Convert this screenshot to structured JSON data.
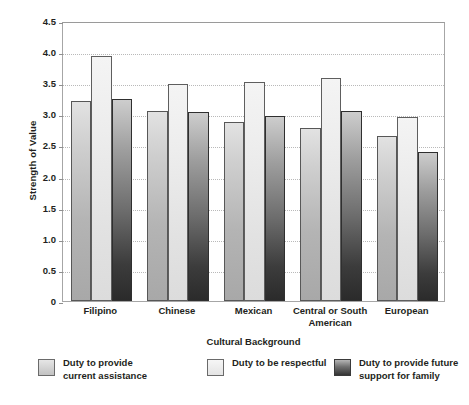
{
  "chart_data": {
    "type": "bar",
    "title": "",
    "xlabel": "Cultural Background",
    "ylabel": "Strength of Value",
    "categories": [
      "Filipino",
      "Chinese",
      "Mexican",
      "Central or South American",
      "European"
    ],
    "series": [
      {
        "name": "Duty to provide current assistance",
        "color": "#c8c8c8",
        "values": [
          3.22,
          3.06,
          2.88,
          2.78,
          2.66
        ]
      },
      {
        "name": "Duty to be respectful",
        "color": "#ededed",
        "values": [
          3.93,
          3.49,
          3.52,
          3.59,
          2.95
        ]
      },
      {
        "name": "Duty to provide future support for family",
        "color": "#4a4a4a",
        "values": [
          3.25,
          3.03,
          2.98,
          3.05,
          2.39
        ]
      }
    ],
    "ylim": [
      0,
      4.5
    ],
    "yticks": [
      "0",
      "0.5",
      "1.0",
      "1.5",
      "2.0",
      "2.5",
      "3.0",
      "3.5",
      "4.0",
      "4.5"
    ],
    "ytick_values": [
      0,
      0.5,
      1.0,
      1.5,
      2.0,
      2.5,
      3.0,
      3.5,
      4.0,
      4.5
    ],
    "grid": true,
    "legend_position": "bottom"
  },
  "legend": {
    "items": [
      {
        "label": "Duty to provide\ncurrent assistance"
      },
      {
        "label": "Duty to be respectful"
      },
      {
        "label": "Duty to provide future\nsupport for family"
      }
    ]
  },
  "xtick_labels": [
    "Filipino",
    "Chinese",
    "Mexican",
    "Central or South\nAmerican",
    "European"
  ]
}
